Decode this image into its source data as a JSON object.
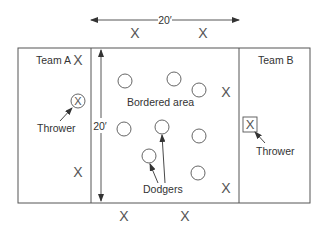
{
  "diagram": {
    "colors": {
      "line": "#555555",
      "text": "#333333",
      "background": "#ffffff"
    },
    "dimensions": {
      "width_label": "20′",
      "height_label": "20′"
    },
    "zones": {
      "team_a": {
        "label": "Team A"
      },
      "center": {
        "label": "Bordered area"
      },
      "team_b": {
        "label": "Team B"
      }
    },
    "labels": {
      "thrower_a": "Thrower",
      "thrower_b": "Thrower",
      "dodgers": "Dodgers"
    },
    "player_marker": "X",
    "players": {
      "team_a_x": [
        {
          "x": 78,
          "y": 60
        },
        {
          "x": 78,
          "y": 172
        }
      ],
      "top_x": [
        {
          "x": 135,
          "y": 33
        },
        {
          "x": 203,
          "y": 33
        }
      ],
      "bottom_x": [
        {
          "x": 124,
          "y": 216
        },
        {
          "x": 185,
          "y": 216
        }
      ],
      "right_x": [
        {
          "x": 226,
          "y": 92
        },
        {
          "x": 226,
          "y": 188
        }
      ],
      "dodger_circles": [
        {
          "x": 125,
          "y": 81
        },
        {
          "x": 174,
          "y": 79
        },
        {
          "x": 199,
          "y": 90
        },
        {
          "x": 124,
          "y": 129
        },
        {
          "x": 162,
          "y": 127
        },
        {
          "x": 199,
          "y": 136
        },
        {
          "x": 149,
          "y": 156
        },
        {
          "x": 198,
          "y": 173
        }
      ]
    }
  }
}
